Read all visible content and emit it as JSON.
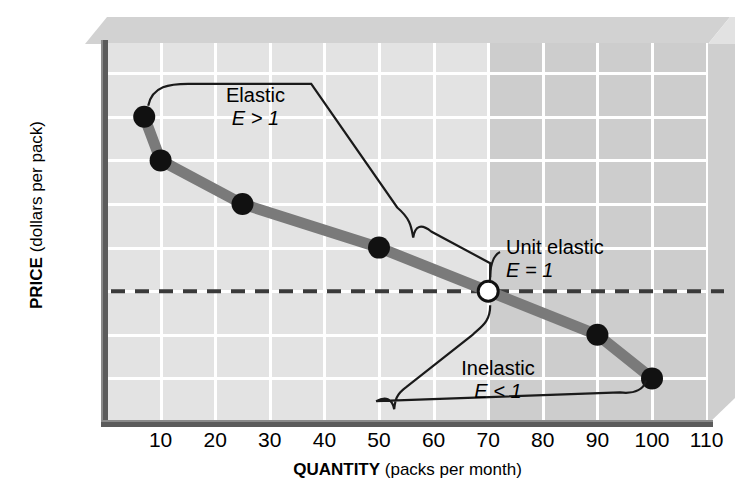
{
  "axes": {
    "y_title_bold": "PRICE",
    "y_title_rest": " (dollars per pack)",
    "x_title_bold": "QUANTITY",
    "x_title_rest": " (packs per month)",
    "y_ticks": [
      "$8",
      "7",
      "6",
      "5",
      "4",
      "3",
      "2",
      "1",
      "0"
    ],
    "x_ticks": [
      "10",
      "20",
      "30",
      "40",
      "50",
      "60",
      "70",
      "80",
      "90",
      "100",
      "110"
    ]
  },
  "annotations": {
    "elastic_label": "Elastic",
    "elastic_formula": "E > 1",
    "unit_label": "Unit elastic",
    "unit_formula": "E = 1",
    "inelastic_label": "Inelastic",
    "inelastic_formula": "E < 1"
  },
  "colors": {
    "curve": "#7a7a7a",
    "point": "#111111",
    "plot_light": "#e3e3e3",
    "plot_dark": "#cdcdcd",
    "axis": "#5b5b5b",
    "grid": "#ffffff"
  },
  "chart_data": {
    "type": "line",
    "title": "",
    "xlabel": "QUANTITY (packs per month)",
    "ylabel": "PRICE (dollars per pack)",
    "xlim": [
      0,
      110
    ],
    "ylim": [
      0,
      8
    ],
    "xticks": [
      10,
      20,
      30,
      40,
      50,
      60,
      70,
      80,
      90,
      100,
      110
    ],
    "yticks": [
      0,
      1,
      2,
      3,
      4,
      5,
      6,
      7,
      8
    ],
    "grid": true,
    "legend": "none",
    "series": [
      {
        "name": "Demand",
        "x": [
          7,
          10,
          25,
          50,
          70,
          90,
          100
        ],
        "y": [
          7,
          6,
          5,
          4,
          3,
          2,
          1
        ],
        "markers": [
          "filled",
          "filled",
          "filled",
          "filled",
          "open",
          "filled",
          "filled"
        ]
      }
    ],
    "reference_lines": [
      {
        "type": "horizontal",
        "value": 3,
        "style": "dashed"
      }
    ],
    "shaded_regions": [
      {
        "x_from": 70,
        "x_to": 110,
        "label": "inelastic-region",
        "color": "#cdcdcd"
      }
    ],
    "annotations": [
      {
        "text": "Elastic",
        "subtext": "E > 1",
        "segment_from_x": 7,
        "segment_to_x": 70
      },
      {
        "text": "Unit elastic",
        "subtext": "E = 1",
        "at_x": 70,
        "at_y": 3
      },
      {
        "text": "Inelastic",
        "subtext": "E < 1",
        "segment_from_x": 70,
        "segment_to_x": 100
      }
    ]
  }
}
